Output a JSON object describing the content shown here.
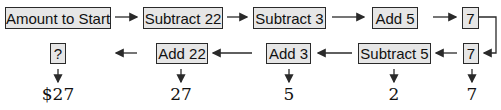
{
  "row_forward": [
    {
      "label": "Amount to Start"
    },
    {
      "label": "Subtract 22"
    },
    {
      "label": "Subtract 3"
    },
    {
      "label": "Add 5"
    },
    {
      "label": "7"
    }
  ],
  "row_backward": [
    {
      "label": "?"
    },
    {
      "label": "Add 22"
    },
    {
      "label": "Add 3"
    },
    {
      "label": "Subtract 5"
    },
    {
      "label": "7"
    }
  ],
  "results": [
    {
      "value": "$27"
    },
    {
      "value": "27"
    },
    {
      "value": "5"
    },
    {
      "value": "2"
    },
    {
      "value": "7"
    }
  ],
  "colors": {
    "box_fill": "#e6e6e6",
    "stroke": "#2a2a2a"
  }
}
